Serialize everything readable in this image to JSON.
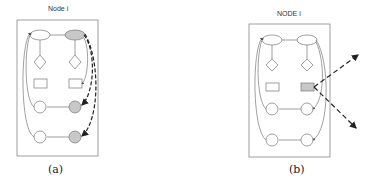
{
  "panels": [
    {
      "id": "a",
      "title": "Node i",
      "caption": "(a)",
      "highlighted": [
        "top-right-ellipse",
        "row3-right-circle",
        "row4-right-circle"
      ],
      "arrow_style": "dashed-to-internal"
    },
    {
      "id": "b",
      "title": "NODE i",
      "caption": "(b)",
      "highlighted": [
        "right-rectangle"
      ],
      "arrow_style": "dashed-outward"
    }
  ],
  "colors": {
    "stroke": "#777777",
    "highlight": "#c8c8c8",
    "dashed": "#222222",
    "background": "#ffffff"
  }
}
